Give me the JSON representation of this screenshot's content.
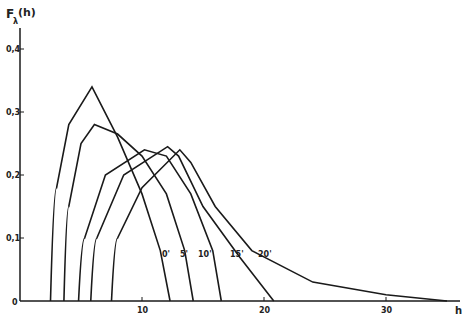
{
  "chart_data": {
    "type": "line",
    "title": "",
    "ylabel": "F_λ(h)",
    "xlabel": "h",
    "xlim": [
      0,
      35
    ],
    "ylim": [
      0,
      0.43
    ],
    "x_ticks": [
      "0",
      "10",
      "20",
      "30"
    ],
    "y_ticks": [
      "0,1",
      "0,2",
      "0,3",
      "0,4"
    ],
    "origin_label": "0",
    "grid": false,
    "series": [
      {
        "name": "20'",
        "points": [
          [
            2.5,
            0
          ],
          [
            3,
            0.18
          ],
          [
            4,
            0.28
          ],
          [
            5.9,
            0.34
          ],
          [
            8,
            0.26
          ],
          [
            10,
            0.17
          ],
          [
            11.5,
            0.08
          ],
          [
            12.3,
            0
          ]
        ]
      },
      {
        "name": "15'",
        "points": [
          [
            3.6,
            0
          ],
          [
            4,
            0.15
          ],
          [
            5,
            0.25
          ],
          [
            6.1,
            0.28
          ],
          [
            8,
            0.265
          ],
          [
            10,
            0.23
          ],
          [
            12,
            0.17
          ],
          [
            13.5,
            0.08
          ],
          [
            14.2,
            0
          ]
        ]
      },
      {
        "name": "10'",
        "points": [
          [
            4.8,
            0
          ],
          [
            5.3,
            0.1
          ],
          [
            7,
            0.2
          ],
          [
            10.2,
            0.24
          ],
          [
            12,
            0.23
          ],
          [
            14,
            0.17
          ],
          [
            15.8,
            0.08
          ],
          [
            16.5,
            0
          ]
        ]
      },
      {
        "name": "5'",
        "points": [
          [
            5.8,
            0
          ],
          [
            6.3,
            0.1
          ],
          [
            8.5,
            0.2
          ],
          [
            12.1,
            0.245
          ],
          [
            13,
            0.23
          ],
          [
            15,
            0.15
          ],
          [
            18,
            0.07
          ],
          [
            20.8,
            0
          ]
        ]
      },
      {
        "name": "0'",
        "points": [
          [
            7.5,
            0
          ],
          [
            8,
            0.1
          ],
          [
            10,
            0.18
          ],
          [
            13.1,
            0.24
          ],
          [
            14,
            0.22
          ],
          [
            16,
            0.15
          ],
          [
            19,
            0.08
          ],
          [
            24,
            0.03
          ],
          [
            30,
            0.01
          ],
          [
            35,
            0
          ]
        ]
      }
    ]
  },
  "labels": {
    "y_axis": "F",
    "y_sub": "λ",
    "y_arg": "(h)",
    "x_axis": "h"
  }
}
